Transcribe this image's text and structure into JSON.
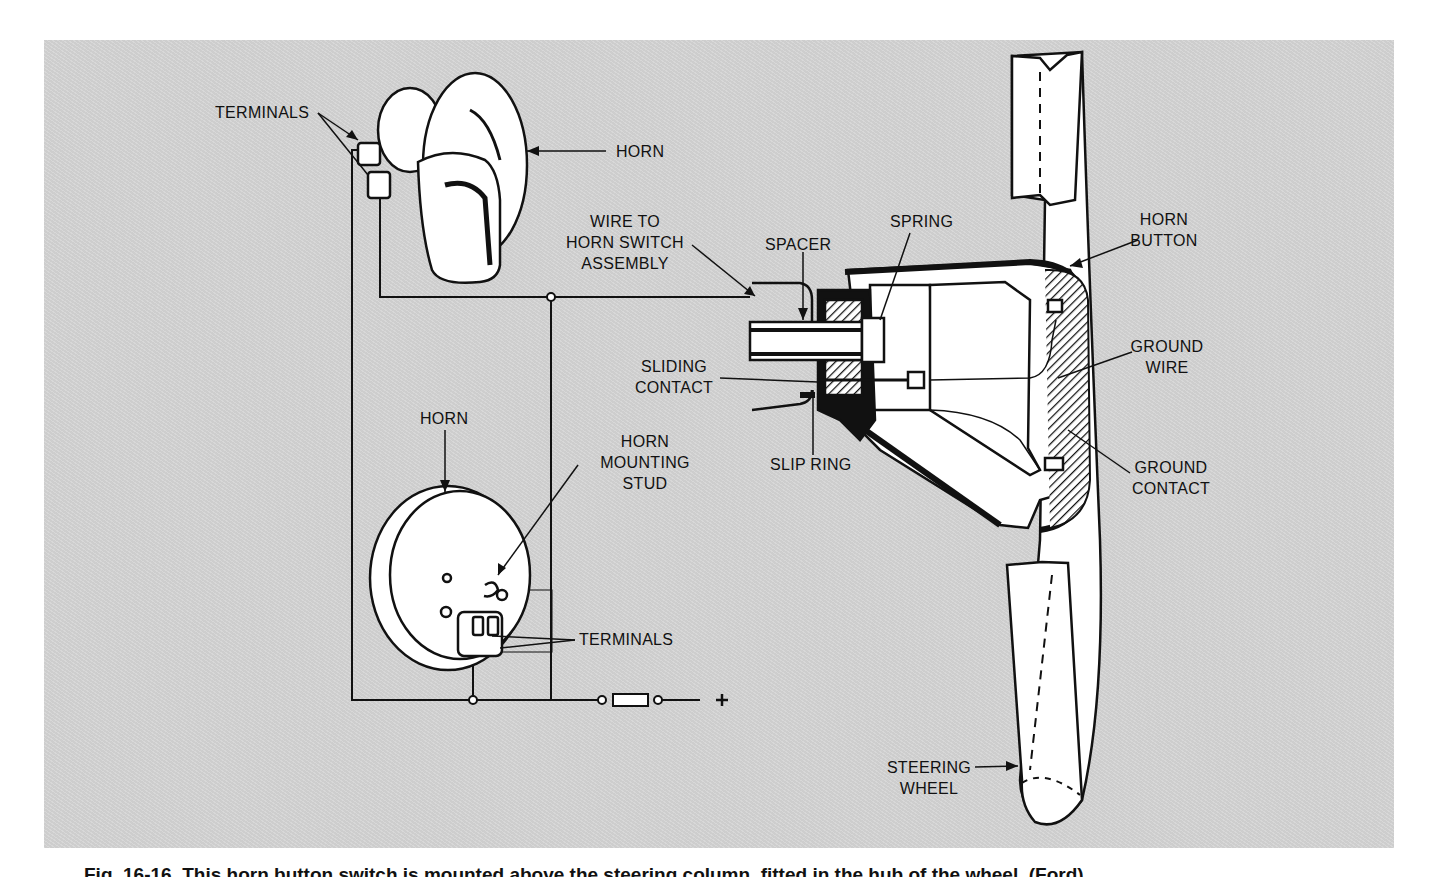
{
  "figure": {
    "background": "#d4d4d4",
    "ink": "#111111",
    "part_fill": "#ffffff"
  },
  "labels": {
    "terminals_top": "TERMINALS",
    "horn_top": "HORN",
    "wire_line1": "WIRE TO",
    "wire_line2": "HORN SWITCH",
    "wire_line3": "ASSEMBLY",
    "spacer": "SPACER",
    "spring": "SPRING",
    "horn_button_line1": "HORN",
    "horn_button_line2": "BUTTON",
    "sliding_line1": "SLIDING",
    "sliding_line2": "CONTACT",
    "ground_wire_line1": "GROUND",
    "ground_wire_line2": "WIRE",
    "horn_bottom": "HORN",
    "mounting_line1": "HORN",
    "mounting_line2": "MOUNTING",
    "mounting_line3": "STUD",
    "slip_ring": "SLIP RING",
    "ground_contact_line1": "GROUND",
    "ground_contact_line2": "CONTACT",
    "terminals_bottom": "TERMINALS",
    "steering_line1": "STEERING",
    "steering_line2": "WHEEL",
    "battery_positive": "+"
  },
  "caption": "Fig. 16-16. This horn button switch is mounted above the steering column, fitted in the hub of the wheel. (Ford)"
}
